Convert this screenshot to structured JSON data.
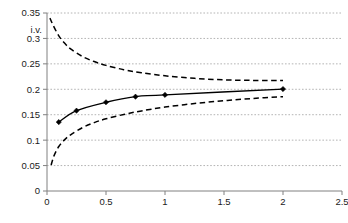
{
  "chart_data": {
    "type": "line",
    "title": "",
    "xlabel": "",
    "ylabel": "i.v.",
    "xlim": [
      0,
      2.5
    ],
    "ylim": [
      0,
      0.35
    ],
    "xticks": [
      "0",
      "0.5",
      "1",
      "1.5",
      "2",
      "2.5"
    ],
    "xtick_values": [
      0,
      0.5,
      1,
      1.5,
      2,
      2.5
    ],
    "yticks": [
      "0",
      "0.05",
      "0.1",
      "0.15",
      "0.2",
      "0.25",
      "0.3",
      "0.35"
    ],
    "ytick_values": [
      0,
      0.05,
      0.1,
      0.15,
      0.2,
      0.25,
      0.3,
      0.35
    ],
    "grid": "horizontal-dotted",
    "legend": "none",
    "series": [
      {
        "name": "implied volatility estimate",
        "style": "solid-with-markers",
        "marker": "diamond",
        "color": "#000000",
        "x": [
          0.1,
          0.25,
          0.5,
          0.75,
          1.0,
          2.0
        ],
        "values": [
          0.1355,
          0.158,
          0.1745,
          0.1855,
          0.189,
          0.2005
        ]
      },
      {
        "name": "upper confidence band",
        "style": "dashed",
        "color": "#000000",
        "x": [
          0.025,
          0.05,
          0.1,
          0.15,
          0.2,
          0.3,
          0.4,
          0.5,
          0.65,
          0.8,
          1.0,
          1.25,
          1.5,
          1.75,
          2.0
        ],
        "values": [
          0.34,
          0.327,
          0.305,
          0.2905,
          0.2795,
          0.2645,
          0.2545,
          0.247,
          0.2385,
          0.2325,
          0.2265,
          0.2215,
          0.2185,
          0.2175,
          0.2175
        ]
      },
      {
        "name": "lower confidence band",
        "style": "dashed",
        "color": "#000000",
        "x": [
          0.035,
          0.06,
          0.1,
          0.15,
          0.2,
          0.3,
          0.4,
          0.5,
          0.65,
          0.8,
          1.0,
          1.25,
          1.5,
          1.75,
          2.0
        ],
        "values": [
          0.051,
          0.0695,
          0.0875,
          0.101,
          0.1105,
          0.1245,
          0.1345,
          0.142,
          0.1505,
          0.1575,
          0.165,
          0.172,
          0.1775,
          0.182,
          0.1855
        ]
      }
    ]
  },
  "axes": {
    "y_axis_title": "i.v.",
    "y_tick_labels": [
      "0.35",
      "0.3",
      "0.25",
      "0.2",
      "0.15",
      "0.1",
      "0.05",
      "0"
    ],
    "x_tick_labels": [
      "0",
      "0.5",
      "1",
      "1.5",
      "2",
      "2.5"
    ]
  },
  "colors": {
    "line": "#000000",
    "grid": "#b4b4b4",
    "axis": "#808080",
    "background": "#ffffff",
    "text": "#1a1a1a"
  }
}
